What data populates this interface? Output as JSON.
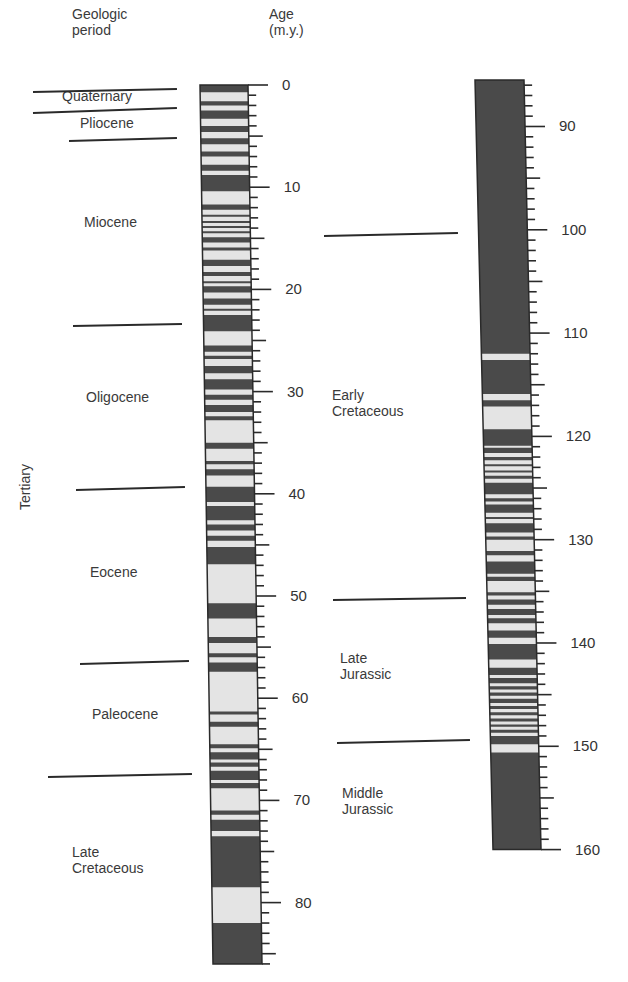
{
  "headers": {
    "period": "Geologic\nperiod",
    "age": "Age\n(m.y.)"
  },
  "colors": {
    "normal": "#4a4a4a",
    "reversed": "#e4e4e4",
    "line": "#2a2a2a",
    "text": "#3a3a3a"
  },
  "periods_left": [
    {
      "label": "Quaternary",
      "x": 62,
      "y": 88
    },
    {
      "label": "Pliocene",
      "x": 80,
      "y": 115
    },
    {
      "label": "Miocene",
      "x": 84,
      "y": 214
    },
    {
      "label": "Oligocene",
      "x": 86,
      "y": 389
    },
    {
      "label": "Eocene",
      "x": 90,
      "y": 564
    },
    {
      "label": "Paleocene",
      "x": 92,
      "y": 706
    },
    {
      "label": "Late\nCretaceous",
      "x": 72,
      "y": 844
    }
  ],
  "era_label": "Tertiary",
  "periods_right": [
    {
      "label": "Early\nCretaceous",
      "x": 332,
      "y": 387
    },
    {
      "label": "Late\nJurassic",
      "x": 340,
      "y": 650
    },
    {
      "label": "Middle\nJurassic",
      "x": 342,
      "y": 785
    }
  ],
  "boundaries_left": [
    {
      "x1": 33,
      "y1": 91,
      "x2": 177,
      "y2": 88
    },
    {
      "x1": 33,
      "y1": 112,
      "x2": 177,
      "y2": 107
    },
    {
      "x1": 69,
      "y1": 140,
      "x2": 177,
      "y2": 137
    },
    {
      "x1": 73,
      "y1": 325,
      "x2": 182,
      "y2": 323
    },
    {
      "x1": 76,
      "y1": 489,
      "x2": 185,
      "y2": 486
    },
    {
      "x1": 80,
      "y1": 663,
      "x2": 189,
      "y2": 660
    },
    {
      "x1": 48,
      "y1": 776,
      "x2": 192,
      "y2": 773
    }
  ],
  "boundaries_right": [
    {
      "x1": 324,
      "y1": 235,
      "x2": 458,
      "y2": 232
    },
    {
      "x1": 333,
      "y1": 599,
      "x2": 466,
      "y2": 597
    },
    {
      "x1": 337,
      "y1": 742,
      "x2": 470,
      "y2": 739
    }
  ],
  "chart_data": {
    "type": "geomagnetic polarity timescale",
    "title": "",
    "ylabel": "Age (m.y.)",
    "legend": {
      "dark": "normal polarity",
      "light": "reversed polarity"
    },
    "columns": [
      {
        "name": "left",
        "range": [
          0,
          86
        ],
        "tick_labels": [
          0,
          10,
          20,
          30,
          40,
          50,
          60,
          70,
          80
        ],
        "minor_tick_step": 1,
        "major_tick_step": 5,
        "normal_intervals": [
          [
            0,
            0.7
          ],
          [
            1.6,
            2.0
          ],
          [
            2.5,
            3.3
          ],
          [
            4.0,
            4.6
          ],
          [
            5.2,
            5.8
          ],
          [
            6.5,
            7.0
          ],
          [
            7.8,
            8.4
          ],
          [
            8.8,
            10.4
          ],
          [
            11.7,
            12.2
          ],
          [
            12.7,
            12.9
          ],
          [
            13.3,
            13.5
          ],
          [
            13.8,
            14.0
          ],
          [
            14.3,
            14.5
          ],
          [
            14.9,
            15.4
          ],
          [
            15.9,
            16.2
          ],
          [
            17.1,
            17.7
          ],
          [
            18.3,
            18.7
          ],
          [
            19.2,
            19.4
          ],
          [
            19.7,
            20.3
          ],
          [
            20.9,
            21.5
          ],
          [
            21.9,
            22.1
          ],
          [
            22.5,
            24.1
          ],
          [
            25.5,
            26.1
          ],
          [
            26.5,
            26.8
          ],
          [
            27.5,
            28.2
          ],
          [
            28.8,
            29.8
          ],
          [
            30.3,
            30.8
          ],
          [
            31.3,
            32.0
          ],
          [
            32.4,
            32.8
          ],
          [
            35.0,
            35.6
          ],
          [
            36.8,
            37.1
          ],
          [
            37.6,
            38.2
          ],
          [
            39.3,
            40.8
          ],
          [
            41.2,
            42.6
          ],
          [
            43.0,
            43.6
          ],
          [
            44.1,
            44.6
          ],
          [
            45.2,
            46.9
          ],
          [
            50.7,
            52.2
          ],
          [
            54.0,
            54.6
          ],
          [
            55.6,
            56.0
          ],
          [
            56.5,
            57.4
          ],
          [
            61.3,
            61.6
          ],
          [
            62.3,
            62.8
          ],
          [
            64.5,
            64.9
          ],
          [
            65.3,
            66.0
          ],
          [
            66.3,
            66.7
          ],
          [
            67.1,
            68.0
          ],
          [
            68.3,
            68.8
          ],
          [
            71.0,
            71.4
          ],
          [
            71.9,
            73.0
          ],
          [
            73.5,
            78.5
          ],
          [
            82.0,
            86.0
          ]
        ]
      },
      {
        "name": "right",
        "range": [
          85.5,
          160
        ],
        "tick_labels": [
          90,
          100,
          110,
          120,
          130,
          140,
          150,
          160
        ],
        "minor_tick_step": 1,
        "major_tick_step": 5,
        "normal_intervals": [
          [
            85.5,
            112.0
          ],
          [
            112.6,
            115.9
          ],
          [
            116.5,
            117.1
          ],
          [
            119.3,
            120.9
          ],
          [
            121.1,
            121.6
          ],
          [
            122.0,
            122.3
          ],
          [
            122.7,
            122.9
          ],
          [
            123.3,
            123.5
          ],
          [
            123.8,
            124.1
          ],
          [
            124.5,
            125.6
          ],
          [
            126.0,
            126.3
          ],
          [
            126.6,
            127.4
          ],
          [
            127.8,
            128.0
          ],
          [
            128.4,
            129.3
          ],
          [
            129.7,
            130.0
          ],
          [
            131.1,
            131.5
          ],
          [
            132.1,
            133.3
          ],
          [
            133.6,
            134.0
          ],
          [
            135.1,
            135.4
          ],
          [
            135.8,
            136.3
          ],
          [
            136.7,
            137.3
          ],
          [
            137.6,
            138.1
          ],
          [
            138.8,
            139.5
          ],
          [
            140.1,
            141.6
          ],
          [
            142.4,
            143.1
          ],
          [
            143.4,
            143.9
          ],
          [
            144.2,
            144.5
          ],
          [
            144.8,
            145.1
          ],
          [
            145.4,
            145.8
          ],
          [
            146.1,
            146.4
          ],
          [
            146.7,
            147.0
          ],
          [
            147.3,
            147.6
          ],
          [
            147.9,
            148.1
          ],
          [
            148.4,
            148.7
          ],
          [
            149.0,
            149.8
          ],
          [
            150.6,
            160.0
          ]
        ]
      }
    ]
  }
}
